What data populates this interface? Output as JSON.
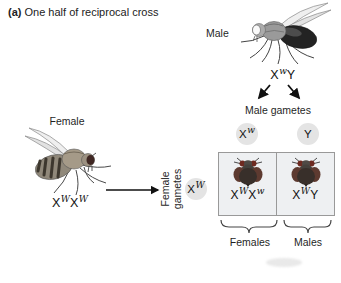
{
  "title": {
    "prefix": "(a)",
    "text": "One half of reciprocal cross"
  },
  "male": {
    "label": "Male",
    "genotype": [
      {
        "base": "X",
        "sup": "w"
      },
      {
        "base": "Y",
        "sup": ""
      }
    ],
    "gametes_label": "Male gametes",
    "gametes": [
      {
        "base": "X",
        "sup": "w"
      },
      {
        "base": "Y",
        "sup": ""
      }
    ]
  },
  "female": {
    "label": "Female",
    "genotype": [
      {
        "base": "X",
        "sup": "W"
      },
      {
        "base": "X",
        "sup": "W"
      }
    ],
    "gametes_label": "Female gametes",
    "gametes": [
      {
        "base": "X",
        "sup": "W"
      }
    ]
  },
  "punnett": {
    "cells": [
      {
        "genotype": [
          {
            "base": "X",
            "sup": "W"
          },
          {
            "base": "X",
            "sup": "w"
          }
        ],
        "fly": "red-eyed-fly-top-view"
      },
      {
        "genotype": [
          {
            "base": "X",
            "sup": "W"
          },
          {
            "base": "Y",
            "sup": ""
          }
        ],
        "fly": "red-eyed-fly-top-view"
      }
    ],
    "group_labels": [
      "Females",
      "Males"
    ]
  },
  "icons": {
    "male_fly": "white-eyed-male-fly-side-view",
    "female_fly": "red-eyed-female-fly-side-view"
  },
  "colors": {
    "gamete_circle_bg": "#e4e4e4",
    "punnett_cell_bg": "#eef0f2",
    "punnett_border": "#999999",
    "red_eye": "#6e2a20",
    "arrow": "#111111"
  }
}
